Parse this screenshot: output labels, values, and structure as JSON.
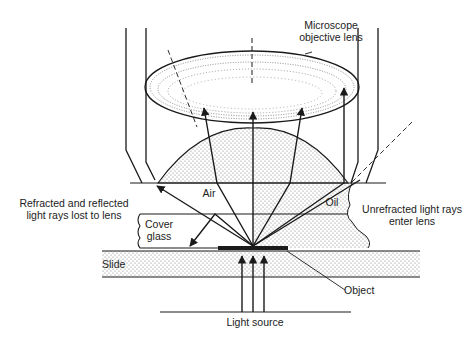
{
  "diagram": {
    "labels": {
      "objective_lens_line1": "Microscope",
      "objective_lens_line2": "objective lens",
      "lost_rays_line1": "Refracted and reflected",
      "lost_rays_line2": "light rays lost to lens",
      "air": "Air",
      "oil": "Oil",
      "unrefracted_line1": "Unrefracted light rays",
      "unrefracted_line2": "enter lens",
      "cover_glass_line1": "Cover",
      "cover_glass_line2": "glass",
      "slide": "Slide",
      "object": "Object",
      "light_source": "Light source"
    },
    "colors": {
      "line": "#1a1a1a",
      "stipple": "#8a8a8a",
      "background": "#ffffff"
    }
  }
}
